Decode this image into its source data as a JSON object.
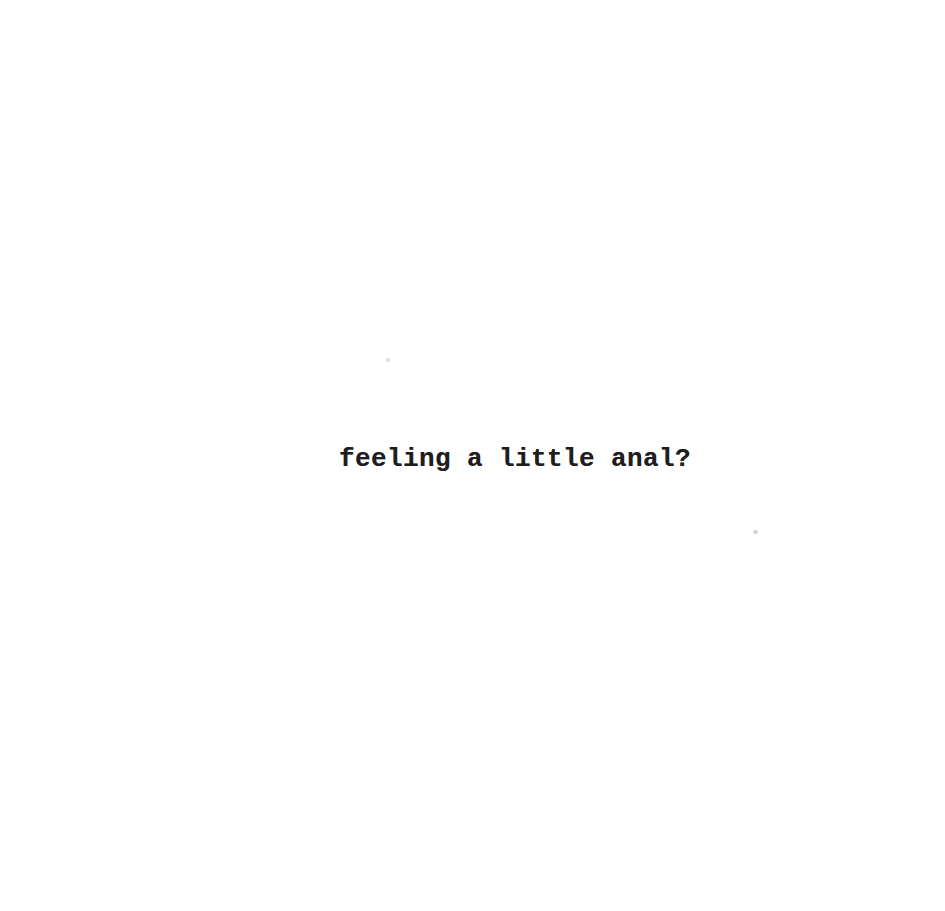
{
  "page": {
    "text": "feeling a little anal?",
    "text_color": "#1f1d1e",
    "background_color": "#ffffff",
    "style": "scanned typewriter print, single centered caption line"
  }
}
